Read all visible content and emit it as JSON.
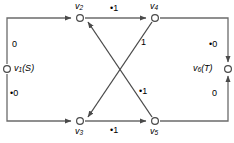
{
  "figure": {
    "type": "network-flow-graph",
    "background": "#ffffff",
    "stroke_color": "#555555",
    "text_color": "#000000",
    "width": 234,
    "height": 143
  },
  "nodes": [
    {
      "id": "v1",
      "name": "v",
      "subscript": "1",
      "annotation": "(S)",
      "label": "v1 (S)",
      "x": 7,
      "y": 69,
      "role": "source"
    },
    {
      "id": "v2",
      "name": "v",
      "subscript": "2",
      "annotation": "",
      "label": "v2",
      "x": 80,
      "y": 18,
      "role": "intermediate"
    },
    {
      "id": "v3",
      "name": "v",
      "subscript": "3",
      "annotation": "",
      "label": "v3",
      "x": 80,
      "y": 121,
      "role": "intermediate"
    },
    {
      "id": "v4",
      "name": "v",
      "subscript": "4",
      "annotation": "",
      "label": "v4",
      "x": 155,
      "y": 18,
      "role": "intermediate"
    },
    {
      "id": "v5",
      "name": "v",
      "subscript": "5",
      "annotation": "",
      "label": "v5",
      "x": 155,
      "y": 121,
      "role": "intermediate"
    },
    {
      "id": "v6",
      "name": "v",
      "subscript": "6",
      "annotation": "(T)",
      "label": "v6 (T)",
      "x": 228,
      "y": 69,
      "role": "sink"
    }
  ],
  "edges": [
    {
      "id": "e-v1-v2",
      "from": "v1",
      "to": "v2",
      "label": "0",
      "marked": false,
      "path": "left-up"
    },
    {
      "id": "e-v1-v3",
      "from": "v1",
      "to": "v3",
      "label": "0",
      "marked": true,
      "path": "left-down"
    },
    {
      "id": "e-v2-v4",
      "from": "v2",
      "to": "v4",
      "label": "1",
      "marked": true,
      "path": "top"
    },
    {
      "id": "e-v3-v5",
      "from": "v3",
      "to": "v5",
      "label": "1",
      "marked": true,
      "path": "bottom"
    },
    {
      "id": "e-v4-v3",
      "from": "v4",
      "to": "v3",
      "label": "1",
      "marked": false,
      "path": "diagonal-down-left"
    },
    {
      "id": "e-v5-v2",
      "from": "v5",
      "to": "v2",
      "label": "1",
      "marked": true,
      "path": "diagonal-up-left"
    },
    {
      "id": "e-v4-v6",
      "from": "v4",
      "to": "v6",
      "label": "0",
      "marked": true,
      "path": "right-down"
    },
    {
      "id": "e-v5-v6",
      "from": "v5",
      "to": "v6",
      "label": "0",
      "marked": false,
      "path": "right-up"
    }
  ],
  "edge_labels": {
    "v1_v2": "0",
    "v1_v3": "•0",
    "v2_v4": "•1",
    "v3_v5": "•1",
    "v4_v3": "1",
    "v5_v2": "•1",
    "v4_v6": "•0",
    "v5_v6": "0"
  },
  "node_text": {
    "v1_name": "v",
    "v1_sub": "1",
    "v1_annot": "(S)",
    "v2_name": "v",
    "v2_sub": "2",
    "v3_name": "v",
    "v3_sub": "3",
    "v4_name": "v",
    "v4_sub": "4",
    "v5_name": "v",
    "v5_sub": "5",
    "v6_name": "v",
    "v6_sub": "6",
    "v6_annot": "(T)"
  }
}
